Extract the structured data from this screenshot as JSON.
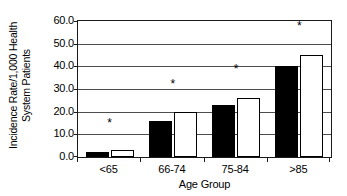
{
  "chart_data": {
    "type": "bar",
    "title": "",
    "xlabel": "Age Group",
    "ylabel": "Incidence Rate/1,000 Health System Patients",
    "ylabel_lines": [
      "Incidence Rate/1,000 Health",
      "System Patients"
    ],
    "categories": [
      "<65",
      "66-74",
      "75-84",
      ">85"
    ],
    "series": [
      {
        "name": "black-series",
        "fill": "#000000",
        "values": [
          2,
          16,
          23,
          40
        ]
      },
      {
        "name": "white-series",
        "fill": "#ffffff",
        "values": [
          3,
          20,
          26,
          45
        ]
      }
    ],
    "ylim": [
      0.0,
      60.0
    ],
    "ytick_values": [
      0.0,
      10.0,
      20.0,
      30.0,
      40.0,
      50.0,
      60.0
    ],
    "ytick_labels": [
      "0.0",
      "10.0",
      "20.0",
      "30.0",
      "40.0",
      "50.0",
      "60.0"
    ],
    "grid": true,
    "grid_axis": "y",
    "legend": "none",
    "annotations": [
      {
        "symbol": "*",
        "category": "<65",
        "value": 15
      },
      {
        "symbol": "*",
        "category": "66-74",
        "value": 32
      },
      {
        "symbol": "*",
        "category": "75-84",
        "value": 39
      },
      {
        "symbol": "*",
        "category": ">85",
        "value": 58
      }
    ],
    "colors": {
      "axis": "#1a1a1a",
      "grid": "#4d4d4d",
      "text": "#000000",
      "background": "#ffffff"
    }
  }
}
